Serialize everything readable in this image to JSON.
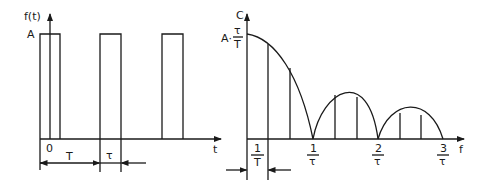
{
  "left_plot": {
    "y_label": "f(t)",
    "x_label": "t",
    "amplitude_label": "A",
    "origin_label": "0",
    "period_label": "T",
    "pulse_width_label": "τ",
    "description": "Periodic rectangular pulse train of amplitude A, period T, pulse width τ"
  },
  "right_plot": {
    "y_label": "C",
    "x_label": "f",
    "peak_label_prefix": "A·",
    "peak_label_num": "τ",
    "peak_label_den": "T",
    "harmonic_spacing": {
      "num": "1",
      "den": "T"
    },
    "zero_ticks": [
      {
        "num": "1",
        "den": "τ"
      },
      {
        "num": "2",
        "den": "τ"
      },
      {
        "num": "3",
        "den": "τ"
      }
    ],
    "description": "Line spectrum with |sinc| envelope; zeros at multiples of 1/τ, lines spaced 1/T"
  },
  "colors": {
    "line": "#1a1a1a",
    "background": "#ffffff"
  }
}
